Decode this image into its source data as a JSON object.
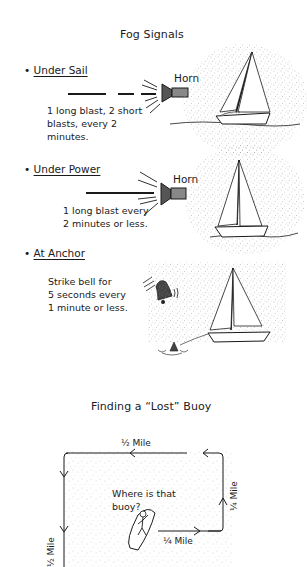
{
  "page": {
    "title": "Fog Signals",
    "sections": [
      {
        "heading": "Under Sail",
        "device_label": "Horn",
        "description": "1 long blast, 2 short blasts, every 2 minutes.",
        "desc_lines": [
          "1 long blast, 2 short",
          "blasts, every 2",
          "minutes."
        ],
        "signal_pattern": [
          "long",
          "short",
          "short"
        ]
      },
      {
        "heading": "Under Power",
        "device_label": "Horn",
        "description": "1 long blast every 2 minutes or less.",
        "desc_lines": [
          "1 long blast every",
          "2 minutes or less."
        ],
        "signal_pattern": [
          "long"
        ]
      },
      {
        "heading": "At Anchor",
        "device_label": "",
        "description": "Strike bell for 5 seconds every 1 minute or less.",
        "desc_lines": [
          "Strike bell for",
          "5 seconds every",
          "1 minute or less."
        ],
        "signal_pattern": [
          "bell"
        ]
      }
    ]
  },
  "buoy_diagram": {
    "title": "Finding a “Lost” Buoy",
    "speech": [
      "Where is that",
      "buoy?"
    ],
    "legs": {
      "top": "½ Mile",
      "right": "¼ Mile",
      "bottom": "¼ Mile",
      "left": "½ Mile"
    }
  },
  "icons": {
    "bullet": "•",
    "horn": "horn-icon",
    "bell": "bell-icon",
    "sailboat": "sailboat-icon",
    "buoy": "buoy-icon",
    "person_in_boat": "person-in-boat-icon"
  },
  "colors": {
    "ink": "#1a1a1a",
    "paper": "#ffffff",
    "fog_stipple": "#9a9a9a"
  }
}
